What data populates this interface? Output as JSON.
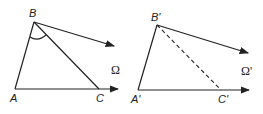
{
  "figure": {
    "left": {
      "labels": {
        "A": "A",
        "B": "B",
        "C": "C",
        "omega": "Ω"
      },
      "segment_BC_style": "solid",
      "angle_mark_at": "B"
    },
    "right": {
      "labels": {
        "A": "A'",
        "B": "B'",
        "C": "C'",
        "omega": "Ω'"
      },
      "segment_BC_style": "dashed"
    }
  }
}
